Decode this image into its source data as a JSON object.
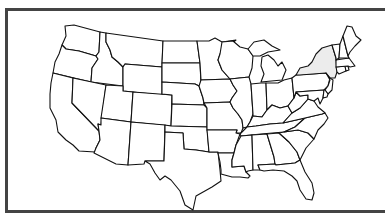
{
  "map": {
    "title": "United States map",
    "region": "Contiguous United States",
    "highlighted_state": "New York",
    "highlight_color": "#ececec",
    "default_fill": "#ffffff",
    "border_color": "#111111",
    "frame_color": "#444444",
    "states": [
      {
        "id": "WA",
        "name": "Washington"
      },
      {
        "id": "OR",
        "name": "Oregon"
      },
      {
        "id": "CA",
        "name": "California"
      },
      {
        "id": "ID",
        "name": "Idaho"
      },
      {
        "id": "NV",
        "name": "Nevada"
      },
      {
        "id": "MT",
        "name": "Montana"
      },
      {
        "id": "WY",
        "name": "Wyoming"
      },
      {
        "id": "UT",
        "name": "Utah"
      },
      {
        "id": "AZ",
        "name": "Arizona"
      },
      {
        "id": "CO",
        "name": "Colorado"
      },
      {
        "id": "NM",
        "name": "New Mexico"
      },
      {
        "id": "ND",
        "name": "North Dakota"
      },
      {
        "id": "SD",
        "name": "South Dakota"
      },
      {
        "id": "NE",
        "name": "Nebraska"
      },
      {
        "id": "KS",
        "name": "Kansas"
      },
      {
        "id": "OK",
        "name": "Oklahoma"
      },
      {
        "id": "TX",
        "name": "Texas"
      },
      {
        "id": "MN",
        "name": "Minnesota"
      },
      {
        "id": "IA",
        "name": "Iowa"
      },
      {
        "id": "MO",
        "name": "Missouri"
      },
      {
        "id": "AR",
        "name": "Arkansas"
      },
      {
        "id": "LA",
        "name": "Louisiana"
      },
      {
        "id": "WI",
        "name": "Wisconsin"
      },
      {
        "id": "IL",
        "name": "Illinois"
      },
      {
        "id": "MI",
        "name": "Michigan"
      },
      {
        "id": "IN",
        "name": "Indiana"
      },
      {
        "id": "OH",
        "name": "Ohio"
      },
      {
        "id": "KY",
        "name": "Kentucky"
      },
      {
        "id": "TN",
        "name": "Tennessee"
      },
      {
        "id": "MS",
        "name": "Mississippi"
      },
      {
        "id": "AL",
        "name": "Alabama"
      },
      {
        "id": "GA",
        "name": "Georgia"
      },
      {
        "id": "FL",
        "name": "Florida"
      },
      {
        "id": "SC",
        "name": "South Carolina"
      },
      {
        "id": "NC",
        "name": "North Carolina"
      },
      {
        "id": "VA",
        "name": "Virginia"
      },
      {
        "id": "WV",
        "name": "West Virginia"
      },
      {
        "id": "PA",
        "name": "Pennsylvania"
      },
      {
        "id": "NY",
        "name": "New York"
      },
      {
        "id": "NJ",
        "name": "New Jersey"
      },
      {
        "id": "MD",
        "name": "Maryland"
      },
      {
        "id": "DE",
        "name": "Delaware"
      },
      {
        "id": "CT",
        "name": "Connecticut"
      },
      {
        "id": "RI",
        "name": "Rhode Island"
      },
      {
        "id": "MA",
        "name": "Massachusetts"
      },
      {
        "id": "VT",
        "name": "Vermont"
      },
      {
        "id": "NH",
        "name": "New Hampshire"
      },
      {
        "id": "ME",
        "name": "Maine"
      }
    ]
  }
}
